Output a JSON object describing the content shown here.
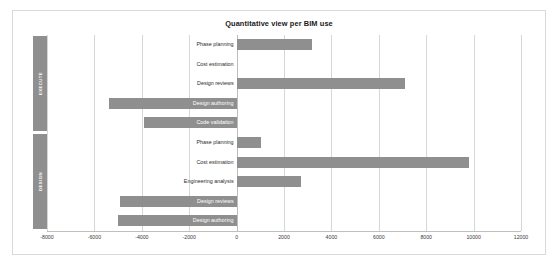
{
  "chart_data": {
    "type": "bar",
    "orientation": "horizontal",
    "title": "Quantitative view per BIM use",
    "xlabel": "",
    "ylabel": "",
    "xlim": [
      -8000,
      12000
    ],
    "xticks": [
      -8000,
      -6000,
      -4000,
      -2000,
      0,
      2000,
      4000,
      6000,
      8000,
      10000,
      12000
    ],
    "xtick_labels": [
      "-8000",
      "-6000",
      "-4000",
      "-2000",
      "0",
      "2000",
      "4000",
      "6000",
      "8000",
      "10000",
      "12000"
    ],
    "grid": true,
    "legend": "none",
    "bar_color": "#8f8f8f",
    "group_label_color": "#8f8f8f",
    "groups": [
      {
        "name": "EXECUTE",
        "categories": [
          "Phase planning",
          "Cost estimation",
          "Design reviews",
          "Design authoring",
          "Code validation"
        ],
        "values": [
          3200,
          0,
          7100,
          -5400,
          -3900
        ]
      },
      {
        "name": "DESIGN",
        "categories": [
          "Phase planning",
          "Cost estimation",
          "Engineering analysis",
          "Design reviews",
          "Design authoring"
        ],
        "values": [
          1050,
          9800,
          2700,
          -4900,
          -5000
        ]
      }
    ]
  }
}
